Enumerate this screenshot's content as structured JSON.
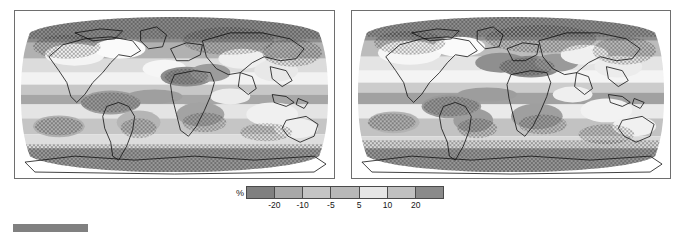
{
  "figure": {
    "name": "global-precipitation-change-maps",
    "panel_count": 2
  },
  "panels": [
    {
      "id": "panel-left",
      "name": "map-panel-left",
      "projection": "Robinson",
      "label": ""
    },
    {
      "id": "panel-right",
      "name": "map-panel-right",
      "projection": "Robinson",
      "label": ""
    }
  ],
  "colorbar": {
    "unit_label": "%",
    "tick_labels": [
      "-20",
      "-10",
      "-5",
      "5",
      "10",
      "20"
    ],
    "segment_count": 7,
    "segment_colors": [
      "#808080",
      "#a8a8a8",
      "#c4c4c4",
      "#b8b8b8",
      "#e6e6e6",
      "#c0c0c0",
      "#8a8a8a"
    ],
    "bin_edges": [
      "-20",
      "-10",
      "-5",
      "5",
      "10",
      "20"
    ]
  },
  "chart_data": {
    "type": "heatmap",
    "title": "",
    "subtitle": "",
    "xlabel": "",
    "ylabel": "",
    "unit": "%",
    "colormap": "grayscale-diverging",
    "legend_position": "bottom-center",
    "grid": false,
    "bin_edges": [
      -20,
      -10,
      -5,
      5,
      10,
      20
    ],
    "bin_labels": [
      "< -20",
      "-20 to -10",
      "-10 to -5",
      "-5 to 5",
      "5 to 10",
      "10 to 20",
      "> 20"
    ],
    "bin_colors": [
      "#808080",
      "#a8a8a8",
      "#c4c4c4",
      "#b8b8b8",
      "#e6e6e6",
      "#c0c0c0",
      "#8a8a8a"
    ],
    "stippling": "dot-hatching marks regions of statistical significance / model agreement",
    "series": [
      {
        "name": "map-panel-left",
        "projection": "Robinson",
        "lon_range": [
          -180,
          180
        ],
        "lat_range": [
          -90,
          90
        ],
        "regions": [
          {
            "region": "Arctic / high northern latitudes",
            "value": 20,
            "stippled": true
          },
          {
            "region": "Northern North America",
            "value": 12,
            "stippled": true
          },
          {
            "region": "Northern Europe / Scandinavia",
            "value": 18,
            "stippled": true
          },
          {
            "region": "Northern Asia / Siberia",
            "value": 20,
            "stippled": true
          },
          {
            "region": "Mediterranean",
            "value": -18,
            "stippled": true
          },
          {
            "region": "North Africa / Sahara",
            "value": -20,
            "stippled": true
          },
          {
            "region": "Southern Africa",
            "value": -12,
            "stippled": true
          },
          {
            "region": "Amazon / Northern South America",
            "value": -8,
            "stippled": false
          },
          {
            "region": "Central America / Caribbean",
            "value": -15,
            "stippled": true
          },
          {
            "region": "Equatorial Pacific",
            "value": 15,
            "stippled": false
          },
          {
            "region": "Subtropical oceans",
            "value": -10,
            "stippled": true
          },
          {
            "region": "Southern Ocean / Antarctic",
            "value": 20,
            "stippled": true
          },
          {
            "region": "Australia",
            "value": -6,
            "stippled": false
          },
          {
            "region": "South Asia / India",
            "value": 8,
            "stippled": false
          }
        ]
      },
      {
        "name": "map-panel-right",
        "projection": "Robinson",
        "lon_range": [
          -180,
          180
        ],
        "lat_range": [
          -90,
          90
        ],
        "regions": [
          {
            "region": "Arctic / high northern latitudes",
            "value": 20,
            "stippled": true
          },
          {
            "region": "Northern North America",
            "value": 14,
            "stippled": true
          },
          {
            "region": "Northern Europe / Scandinavia",
            "value": 16,
            "stippled": true
          },
          {
            "region": "Northern Asia / Siberia",
            "value": 20,
            "stippled": true
          },
          {
            "region": "Mediterranean",
            "value": -20,
            "stippled": true
          },
          {
            "region": "North Africa / Sahara",
            "value": -20,
            "stippled": true
          },
          {
            "region": "Southern Africa",
            "value": -14,
            "stippled": true
          },
          {
            "region": "Amazon / Northern South America",
            "value": -12,
            "stippled": false
          },
          {
            "region": "Central America / Caribbean",
            "value": -16,
            "stippled": true
          },
          {
            "region": "Equatorial Pacific",
            "value": 14,
            "stippled": false
          },
          {
            "region": "Subtropical oceans",
            "value": -10,
            "stippled": true
          },
          {
            "region": "Southern Ocean / Antarctic",
            "value": 20,
            "stippled": true
          },
          {
            "region": "Australia",
            "value": -8,
            "stippled": false
          },
          {
            "region": "South Asia / India",
            "value": 6,
            "stippled": false
          }
        ]
      }
    ]
  }
}
